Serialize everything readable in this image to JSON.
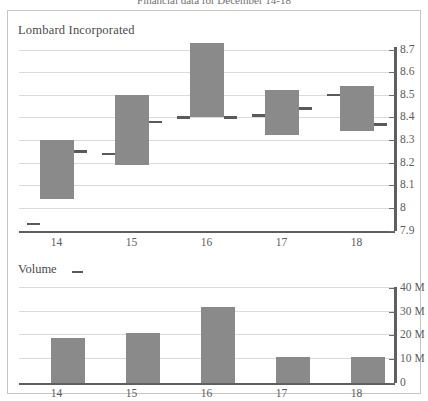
{
  "top_caption": "Financial data for December 14-18",
  "price_panel": {
    "title": "Lombard Incorporated",
    "y_ticks": [
      "8.7",
      "8.6",
      "8.5",
      "8.4",
      "8.3",
      "8.2",
      "8.1",
      "8",
      "7.9"
    ],
    "x_ticks": [
      "14",
      "15",
      "16",
      "17",
      "18"
    ]
  },
  "volume_panel": {
    "title": "Volume",
    "legend_marker": "dash-marker",
    "y_ticks": [
      "40 M",
      "30 M",
      "20 M",
      "10 M",
      "0"
    ],
    "x_ticks": [
      "14",
      "15",
      "16",
      "17",
      "18"
    ]
  },
  "colors": {
    "bar_fill": "#8a8a8a",
    "tick_mark": "#5a5a5a",
    "gridline": "#dcdad6",
    "axis": "#5f5f5f",
    "frame": "#c9c6c0",
    "text": "#5c5c5c"
  },
  "chart_data": [
    {
      "type": "bar",
      "chart_role": "price-ohlc",
      "title": "Lombard Incorporated",
      "xlabel": "",
      "ylabel": "",
      "ylim": [
        7.9,
        8.7
      ],
      "ytick_step": 0.1,
      "grid": true,
      "legend": "none",
      "categories": [
        "14",
        "15",
        "16",
        "17",
        "18"
      ],
      "series": [
        {
          "name": "Open",
          "values": [
            7.93,
            8.24,
            8.4,
            8.41,
            8.5
          ]
        },
        {
          "name": "High",
          "values": [
            8.3,
            8.5,
            8.73,
            8.52,
            8.54
          ]
        },
        {
          "name": "Low",
          "values": [
            8.04,
            8.19,
            8.4,
            8.32,
            8.34
          ]
        },
        {
          "name": "Close",
          "values": [
            8.25,
            8.38,
            8.4,
            8.44,
            8.37
          ]
        }
      ]
    },
    {
      "type": "bar",
      "chart_role": "volume",
      "title": "Volume",
      "xlabel": "",
      "ylabel": "",
      "ylim": [
        0,
        40
      ],
      "ytick_step": 10,
      "unit": "M",
      "grid": true,
      "legend": "none",
      "categories": [
        "14",
        "15",
        "16",
        "17",
        "18"
      ],
      "values": [
        19,
        21,
        32,
        11,
        11
      ]
    }
  ]
}
